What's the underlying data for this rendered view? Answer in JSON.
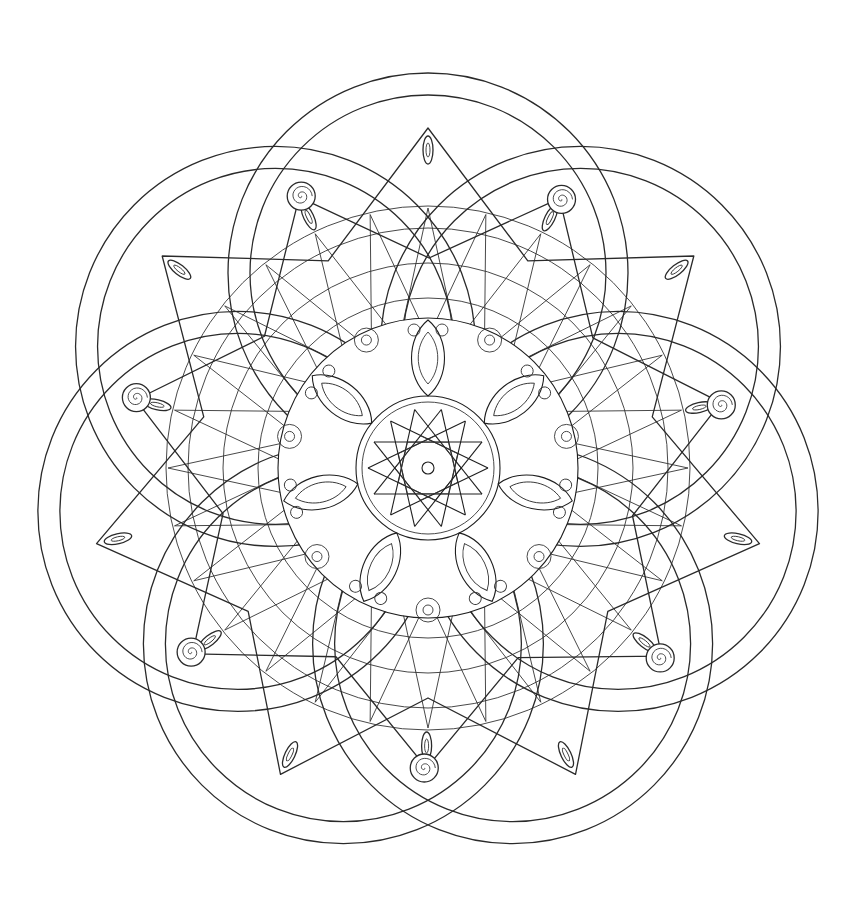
{
  "artwork": {
    "title": "Mandala line art",
    "background": "#ffffff",
    "ink": "#2a2a2a",
    "center": [
      428,
      468
    ],
    "rings": {
      "count": 7,
      "rotation_deg": -90,
      "orbit_radius": 195,
      "outer_radius": 200,
      "inner_radius": 178
    },
    "star_frame": {
      "points": 7,
      "tip_radius": 340,
      "valley_radius": 230,
      "rotation_deg": -90
    },
    "secondary_tips": {
      "points": 7,
      "tip_radius": 300,
      "rotation_deg": -64
    },
    "spirals": {
      "count": 7,
      "radius": 300,
      "rotation_deg": -115,
      "size": 14
    },
    "radial_web": {
      "spokes": 28,
      "inner_radius": 130,
      "outer_radius": 260,
      "circles": [
        135,
        170,
        205,
        240,
        262
      ]
    },
    "core": {
      "petals": 7,
      "outer_radius": 150,
      "mid_radius": 110,
      "inner_radius": 72,
      "star_lines": 14,
      "star_radius": 60
    }
  }
}
